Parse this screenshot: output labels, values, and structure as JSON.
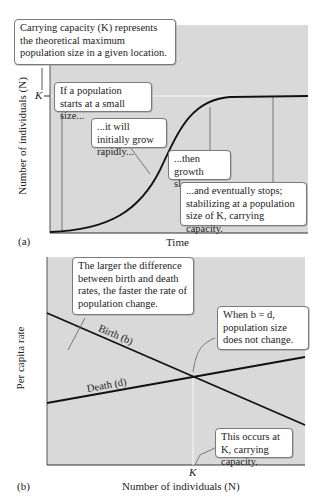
{
  "panel_a": {
    "tag": "(a)",
    "x_axis_label": "Time",
    "y_axis_label": "Number of individuals (N)",
    "k_tick_label": "K",
    "callouts": {
      "carrying_capacity": "Carrying capacity (K) represents the theoretical maximum population size in a given location.",
      "small_start": "If a population starts at a small size...",
      "grow_rapidly": "...it will initially grow rapidly...",
      "growth_slows": "...then growth slows...",
      "eventually_stops": "...and eventually stops; stabilizing at a population size of K, carrying capacity."
    }
  },
  "panel_b": {
    "tag": "(b)",
    "x_axis_label": "Number of individuals (N)",
    "y_axis_label": "Per capita rate",
    "k_tick_label": "K",
    "birth_label": "Birth (b)",
    "death_label": "Death (d)",
    "callouts": {
      "larger_difference": "The larger the difference between birth and death rates, the faster the rate of population change.",
      "b_equals_d": "When b = d, population size does not change.",
      "occurs_at_k": "This occurs at K, carrying capacity."
    }
  },
  "colors": {
    "plot_background": "#d9d9d9",
    "curve": "#1a1a1a",
    "leader_line": "#777777",
    "k_line": "#ffffff"
  }
}
